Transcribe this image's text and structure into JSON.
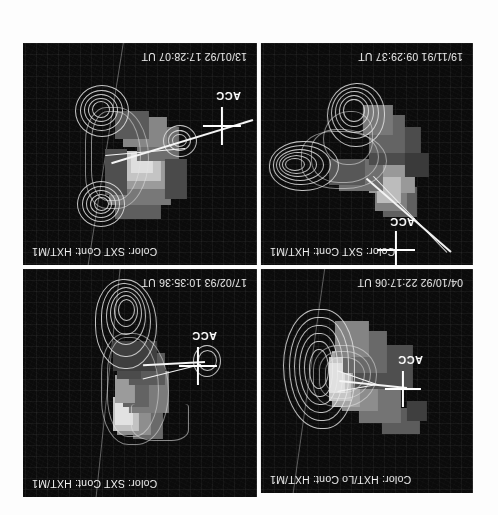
{
  "figure": {
    "orientation": "rotated-180",
    "background_color": "#ffffff",
    "panel_background_color": "#0b0b0b",
    "overlay_color": "#ffffff",
    "marker_label": "ACC",
    "rows": 2,
    "columns": 2
  },
  "panels": [
    {
      "position": "top-left",
      "header": "Color: HXT/Lo  Cont: HXT/M1",
      "color_channel": "HXT/Lo",
      "contour_channel": "HXT/M1",
      "timestamp": "04/10/92  22:17:06 UT",
      "date": "04/10/92",
      "time": "22:17:06 UT",
      "marker_label": "ACC"
    },
    {
      "position": "top-right",
      "header": "Color: SXT  Cont: HXT/M1",
      "color_channel": "SXT",
      "contour_channel": "HXT/M1",
      "timestamp": "17/02/93  10:35:36 UT",
      "date": "17/02/93",
      "time": "10:35:36 UT",
      "marker_label": "ACC"
    },
    {
      "position": "bottom-left",
      "header": "Color: SXT  Cont: HXT/M1",
      "color_channel": "SXT",
      "contour_channel": "HXT/M1",
      "timestamp": "19/11/91  09:29:37 UT",
      "date": "19/11/91",
      "time": "09:29:37 UT",
      "marker_label": "ACC"
    },
    {
      "position": "bottom-right",
      "header": "Color: SXT  Cont: HXT/M1",
      "color_channel": "SXT",
      "contour_channel": "HXT/M1",
      "timestamp": "13/01/92  17:28:07 UT",
      "date": "13/01/92",
      "time": "17:28:07 UT",
      "marker_label": "ACC"
    }
  ]
}
